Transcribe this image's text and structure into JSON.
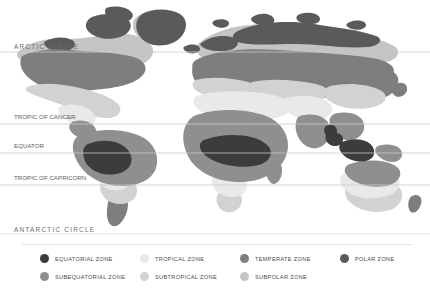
{
  "background_color": "#ffffff",
  "latitude_lines": [
    {
      "id": "arctic-circle",
      "label": "ARCTIC CIRCLE",
      "y": 52,
      "label_y": 43,
      "label_x": 14,
      "spaced": true,
      "line_color": "#c9c9c9"
    },
    {
      "id": "tropic-of-cancer",
      "label": "TROPIC OF CANCER",
      "y": 124,
      "label_y": 113,
      "label_x": 14,
      "spaced": false,
      "line_color": "#c9c9c9"
    },
    {
      "id": "equator",
      "label": "EQUATOR",
      "y": 153,
      "label_y": 142,
      "label_x": 14,
      "spaced": false,
      "line_color": "#c9c9c9"
    },
    {
      "id": "tropic-of-capricorn",
      "label": "TROPIC OF CAPRICORN",
      "y": 185,
      "label_y": 174,
      "label_x": 14,
      "spaced": false,
      "line_color": "#c9c9c9"
    },
    {
      "id": "antarctic-circle",
      "label": "ANTARCTIC CIRCLE",
      "y": 234,
      "label_y": 226,
      "label_x": 14,
      "spaced": true,
      "line_color": "#c9c9c9"
    }
  ],
  "zone_colors": {
    "equatorial": "#3c3c3c",
    "subequatorial": "#8f8f8f",
    "tropical": "#e9e9e9",
    "subtropical": "#d2d2d2",
    "temperate": "#7e7e7e",
    "subpolar": "#c4c4c4",
    "polar": "#5a5a5a"
  },
  "legend": {
    "items": [
      {
        "id": "equatorial-zone",
        "label": "EQUATORIAL ZONE",
        "color": "#3c3c3c",
        "x": 40,
        "y": 4
      },
      {
        "id": "tropical-zone",
        "label": "TROPICAL ZONE",
        "color": "#e9e9e9",
        "x": 140,
        "y": 4
      },
      {
        "id": "temperate-zone",
        "label": "TEMPERATE ZONE",
        "color": "#7e7e7e",
        "x": 240,
        "y": 4
      },
      {
        "id": "polar-zone",
        "label": "POLAR ZONE",
        "color": "#5a5a5a",
        "x": 340,
        "y": 4
      },
      {
        "id": "subequatorial-zone",
        "label": "SUBEQUATORIAL ZONE",
        "color": "#8f8f8f",
        "x": 40,
        "y": 22
      },
      {
        "id": "subtropical-zone",
        "label": "SUBTROPICAL ZONE",
        "color": "#d2d2d2",
        "x": 140,
        "y": 22
      },
      {
        "id": "subpolar-zone",
        "label": "SUBPOLAR ZONE",
        "color": "#c4c4c4",
        "x": 240,
        "y": 22
      }
    ]
  }
}
